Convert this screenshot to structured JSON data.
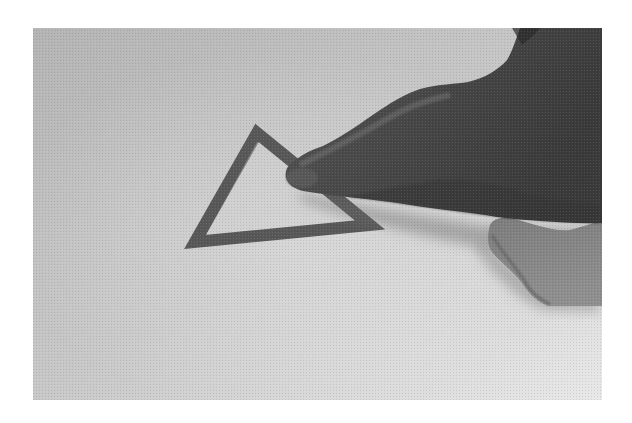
{
  "image": {
    "description": "Grayscale photograph of a hand with an index finger touching the right corner of a dark triangle outline drawn on a light textured surface",
    "colors": {
      "surface_dark": "#b6b6b6",
      "surface_light": "#e4e4e4",
      "triangle_stroke": "#555555",
      "hand_dark": "#3a3a3a",
      "hand_mid": "#4e4e4e",
      "hand_light": "#7a7a7a",
      "lower_finger": "#8a8a8a"
    },
    "shapes": {
      "triangle": {
        "label": "triangle outline",
        "vertices": [
          [
            257,
            133
          ],
          [
            195,
            242
          ],
          [
            370,
            225
          ]
        ]
      }
    }
  }
}
